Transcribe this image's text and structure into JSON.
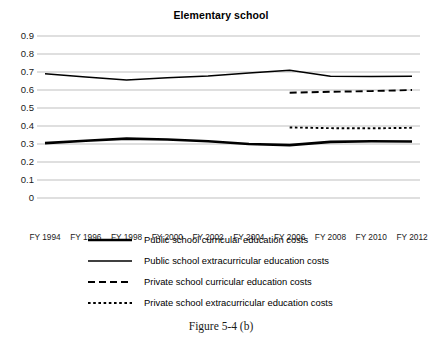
{
  "chart_data": {
    "type": "line",
    "title": "Elementary school",
    "caption": "Figure 5-4 (b)",
    "xlabel": "",
    "ylabel": "",
    "grid": true,
    "legend_position": "bottom",
    "ylim": [
      0,
      0.9
    ],
    "ytick_labels": [
      "0.9",
      "0.8",
      "0.7",
      "0.6",
      "0.5",
      "0.4",
      "0.3",
      "0.2",
      "0.1",
      "0"
    ],
    "ytick_values": [
      0.9,
      0.8,
      0.7,
      0.6,
      0.5,
      0.4,
      0.3,
      0.2,
      0.1,
      0
    ],
    "categories": [
      "FY 1994",
      "FY 1996",
      "FY 1998",
      "FY 2000",
      "FY 2002",
      "FY 2004",
      "FY 2006",
      "FY 2008",
      "FY 2010",
      "FY 2012"
    ],
    "x_values": [
      1994,
      1996,
      1998,
      2000,
      2002,
      2004,
      2006,
      2008,
      2010,
      2012
    ],
    "series": [
      {
        "name": "Public school curricular education costs",
        "style": "thick-solid",
        "color": "#000000",
        "x": [
          1994,
          1996,
          1998,
          2000,
          2002,
          2004,
          2006,
          2008,
          2010,
          2012
        ],
        "values": [
          0.305,
          0.318,
          0.33,
          0.325,
          0.315,
          0.3,
          0.294,
          0.312,
          0.315,
          0.314
        ]
      },
      {
        "name": "Public school extracurricular education costs",
        "style": "thin-solid",
        "color": "#000000",
        "x": [
          1994,
          1996,
          1998,
          2000,
          2002,
          2004,
          2006,
          2008,
          2010,
          2012
        ],
        "values": [
          0.69,
          0.672,
          0.655,
          0.668,
          0.678,
          0.694,
          0.71,
          0.676,
          0.675,
          0.676
        ]
      },
      {
        "name": "Private school curricular education costs",
        "style": "dashed",
        "color": "#000000",
        "x": [
          2006,
          2008,
          2010,
          2012
        ],
        "values": [
          0.585,
          0.59,
          0.594,
          0.6
        ]
      },
      {
        "name": "Private school extracurricular education costs",
        "style": "dotted",
        "color": "#000000",
        "x": [
          2006,
          2008,
          2010,
          2012
        ],
        "values": [
          0.392,
          0.388,
          0.387,
          0.39
        ]
      }
    ]
  }
}
